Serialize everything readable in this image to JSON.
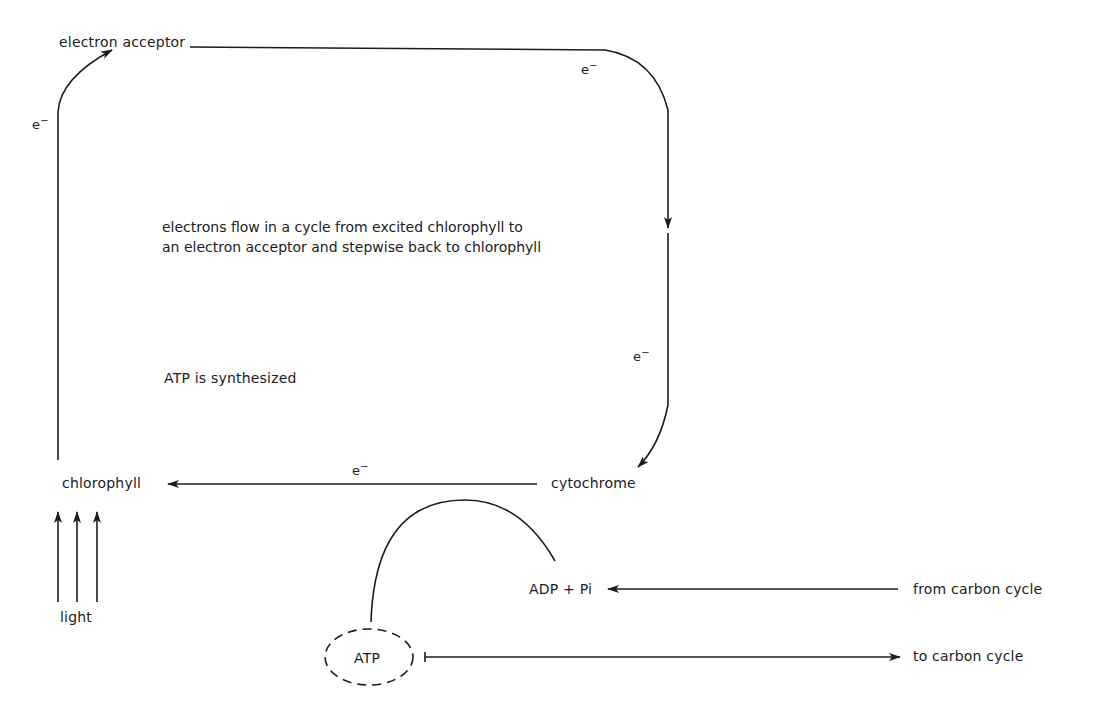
{
  "diagram": {
    "nodes": {
      "electron_acceptor": "electron acceptor",
      "chlorophyll": "chlorophyll",
      "cytochrome": "cytochrome",
      "light": "light",
      "adp_pi": "ADP + Pi",
      "atp": "ATP",
      "from_carbon_cycle": "from carbon cycle",
      "to_carbon_cycle": "to carbon cycle"
    },
    "electron_labels": {
      "left": "e",
      "top_right": "e",
      "right": "e",
      "bottom": "e",
      "charge": "−"
    },
    "annotations": {
      "cycle_line1": "electrons flow in a cycle from excited chlorophyll to",
      "cycle_line2": "an electron acceptor and stepwise back to chlorophyll",
      "atp_synthesized": "ATP is synthesized"
    },
    "edges": [
      {
        "from": "light",
        "to": "chlorophyll",
        "label": ""
      },
      {
        "from": "chlorophyll",
        "to": "electron acceptor",
        "label": "e−"
      },
      {
        "from": "electron acceptor",
        "to": "cytochrome",
        "label": "e−"
      },
      {
        "from": "cytochrome",
        "to": "chlorophyll",
        "label": "e−"
      },
      {
        "from": "ADP + Pi",
        "to": "ATP",
        "label": ""
      },
      {
        "from": "from carbon cycle",
        "to": "ADP + Pi",
        "label": ""
      },
      {
        "from": "ATP",
        "to": "to carbon cycle",
        "label": ""
      }
    ],
    "colors": {
      "ink": "#1c1c1c",
      "background": "#ffffff"
    }
  }
}
